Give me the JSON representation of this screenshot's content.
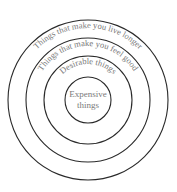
{
  "diagram": {
    "type": "concentric-circles",
    "center": {
      "x": 88,
      "y": 100
    },
    "colors": {
      "ring_stroke": "#2a2a2a",
      "label_text": "#7a7a7a",
      "background": "#ffffff"
    },
    "rings": [
      {
        "label": "Things that make you live longer",
        "radius": 80
      },
      {
        "label": "Things that make you feel good",
        "radius": 62
      },
      {
        "label": "Desirable things",
        "radius": 44
      },
      {
        "label": "Expensive things",
        "radius": 23,
        "center_lines": [
          "Expensive",
          "things"
        ]
      }
    ]
  }
}
